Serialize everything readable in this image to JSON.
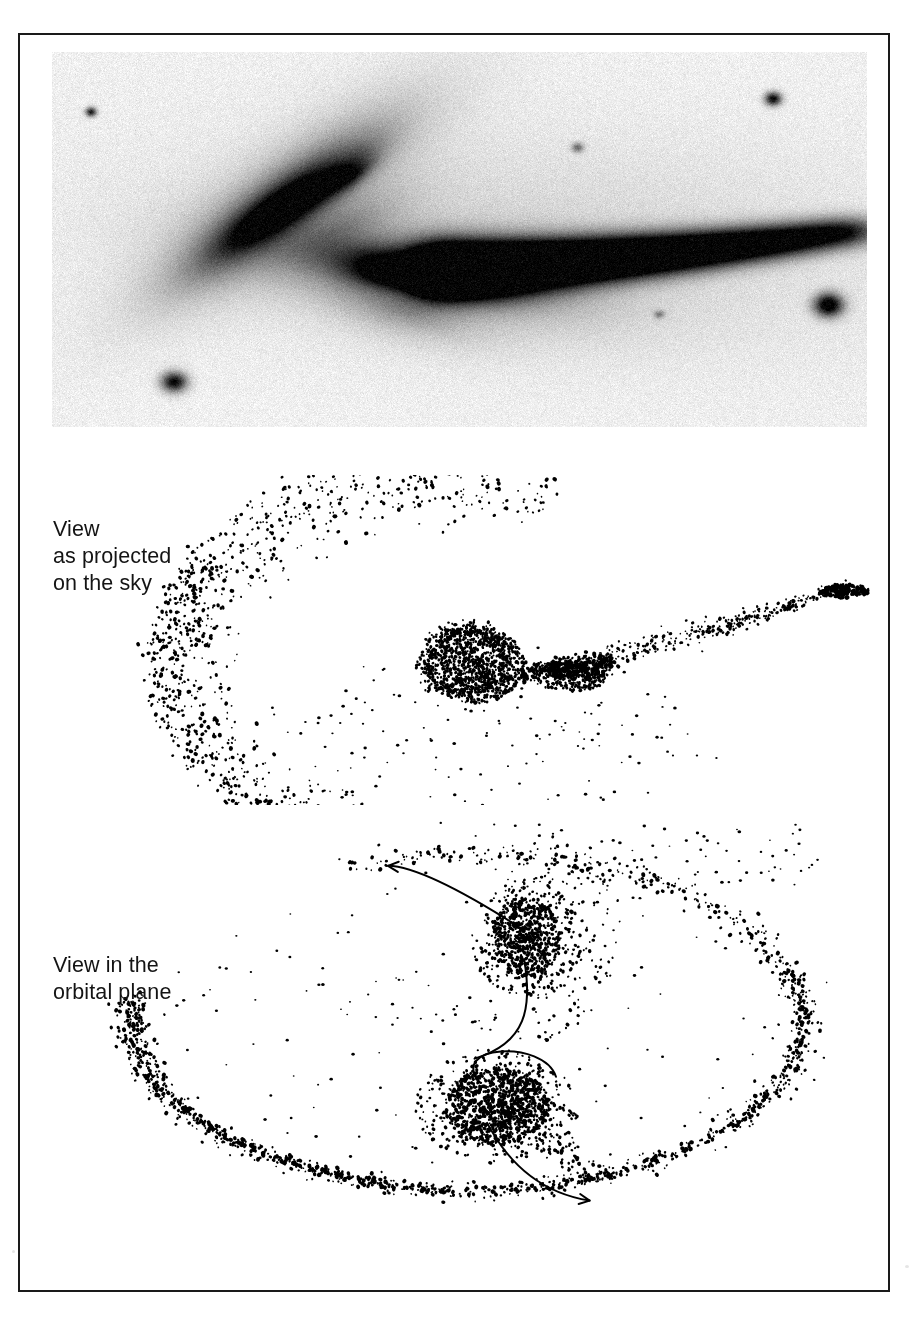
{
  "figure": {
    "kind": "scientific-figure",
    "background_color": "#ffffff",
    "frame_color": "#1a1a1a",
    "ink_color": "#000000"
  },
  "panels": [
    {
      "id": "photograph",
      "name": "observed-photograph",
      "type": "grayscale-photographic-plate",
      "label": "",
      "plate_tone": "#f2f2f0",
      "features": [
        {
          "name": "companion-galaxy",
          "x": 0.27,
          "y": 0.4,
          "note": "elongated bright companion, upper left"
        },
        {
          "name": "primary-galaxy",
          "x": 0.44,
          "y": 0.58,
          "note": "main disk galaxy, center"
        },
        {
          "name": "tidal-tail",
          "note": "long narrow tail extending to the right edge"
        },
        {
          "name": "foreground-star-upper-right",
          "x": 0.88,
          "y": 0.12
        },
        {
          "name": "foreground-star-right",
          "x": 0.95,
          "y": 0.68
        },
        {
          "name": "foreground-star-lower-left",
          "x": 0.15,
          "y": 0.88
        }
      ]
    },
    {
      "id": "sky",
      "name": "view-as-projected-on-the-sky",
      "type": "n-body-particle-plot",
      "label": "View\nas projected\non the sky",
      "label_lines": [
        "View",
        "as projected",
        "on the sky"
      ],
      "has_arrows": false
    },
    {
      "id": "orbital",
      "name": "view-in-the-orbital-plane",
      "type": "n-body-particle-plot",
      "label": "View in the\norbital plane",
      "label_lines": [
        "View in the",
        "orbital plane"
      ],
      "has_arrows": true,
      "annotations": [
        {
          "name": "velocity-arrow-upper",
          "direction": "up-left",
          "from": "companion-galaxy"
        },
        {
          "name": "orbit-trajectory-curve",
          "shape": "s-curve",
          "note": "connects the two galaxy cores"
        },
        {
          "name": "velocity-arrow-lower",
          "direction": "down-right",
          "from": "primary-galaxy"
        }
      ]
    }
  ],
  "chart_data": {
    "type": "scatter",
    "title": "",
    "xlabel": "",
    "ylabel": "",
    "grid": false,
    "legend": "none",
    "panels": [
      {
        "name": "View as projected on the sky",
        "series": [
          {
            "name": "primary-galaxy-core",
            "n_points": 900,
            "center": [
              0.505,
              0.58
            ],
            "radius": 0.055,
            "role": "dense-core"
          },
          {
            "name": "companion-core",
            "n_points": 300,
            "center": [
              0.615,
              0.6
            ],
            "radius": 0.035,
            "role": "secondary-core"
          },
          {
            "name": "counter-arm-sweep",
            "n_points": 560,
            "role": "broad-arc-left",
            "span_deg": [
              95,
              255
            ]
          },
          {
            "name": "tidal-tail",
            "n_points": 320,
            "role": "narrow-tail-right",
            "end": [
              0.93,
              0.34
            ]
          },
          {
            "name": "scattered-debris",
            "n_points": 70,
            "role": "sparse-field"
          }
        ]
      },
      {
        "name": "View in the orbital plane",
        "series": [
          {
            "name": "primary-galaxy-core",
            "n_points": 900,
            "center": [
              0.53,
              0.72
            ],
            "radius": 0.055,
            "role": "dense-core"
          },
          {
            "name": "companion-core",
            "n_points": 520,
            "center": [
              0.565,
              0.33
            ],
            "radius": 0.048,
            "role": "secondary-core"
          },
          {
            "name": "outer-ring-arc",
            "n_points": 780,
            "role": "large-open-arc",
            "span_deg": [
              300,
              640
            ]
          },
          {
            "name": "scattered-debris",
            "n_points": 110,
            "role": "sparse-field"
          }
        ]
      }
    ]
  }
}
